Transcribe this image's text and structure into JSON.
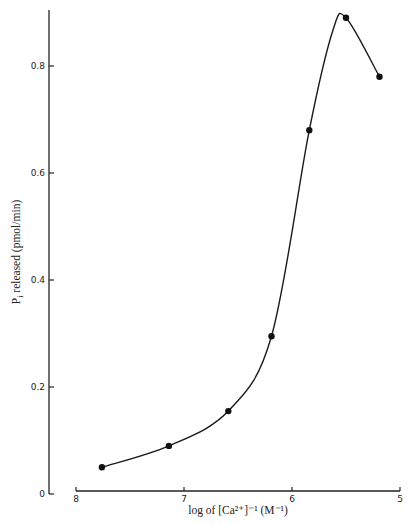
{
  "chart_data": {
    "type": "scatter",
    "title": "",
    "xlabel": "log of [Ca²⁺]⁻¹ (M⁻¹)",
    "ylabel": "P_i released (pmol/min)",
    "x_reversed": true,
    "xlim": [
      8,
      5
    ],
    "ylim": [
      0,
      0.9
    ],
    "x_ticks": [
      8,
      7,
      6,
      5
    ],
    "x_tick_labels": [
      "8",
      "7",
      "6",
      "5"
    ],
    "y_ticks": [
      0,
      0.2,
      0.4,
      0.6,
      0.8
    ],
    "y_tick_labels": [
      "0",
      "0.2",
      "0.4",
      "0.6",
      "0.8"
    ],
    "grid": false,
    "legend": null,
    "series": [
      {
        "name": "Pi release",
        "marker": "filled-circle",
        "line": "smooth-fit",
        "x": [
          7.76,
          7.14,
          6.59,
          6.19,
          5.84,
          5.5,
          5.19
        ],
        "y": [
          0.05,
          0.09,
          0.155,
          0.295,
          0.68,
          0.89,
          0.78
        ]
      }
    ]
  },
  "labels": {
    "x_axis": "log of [Ca²⁺]⁻¹ (M⁻¹)",
    "y_axis_main": "P",
    "y_axis_sub": "i",
    "y_axis_rest": " released (pmol/min)"
  },
  "colors": {
    "ink": "#1a1a1a",
    "background": "#ffffff"
  }
}
